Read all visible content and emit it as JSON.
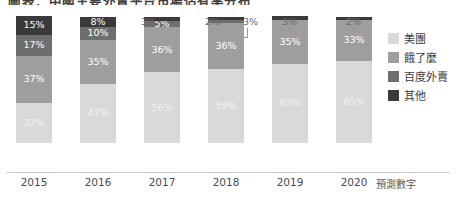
{
  "title": "圖表：中國主要外賣平台市場佔有率分布",
  "axis": {
    "categories": [
      "2015",
      "2016",
      "2017",
      "2018",
      "2019",
      "2020"
    ],
    "forecast_note": "預測數字"
  },
  "legend": {
    "position": "right",
    "items": [
      {
        "label": "美團",
        "color": "#d9d9d9"
      },
      {
        "label": "餓了麼",
        "color": "#9e9e9e"
      },
      {
        "label": "百度外賣",
        "color": "#6e6e6e"
      },
      {
        "label": "其他",
        "color": "#3a3a3a"
      }
    ]
  },
  "chart_data": {
    "type": "bar",
    "subtype": "100%-stacked-column",
    "title": "圖表：中國主要外賣平台市場佔有率分布",
    "xlabel": "",
    "ylabel": "",
    "ylim": [
      0,
      100
    ],
    "grid": false,
    "unit": "%",
    "categories": [
      "2015",
      "2016",
      "2017",
      "2018",
      "2019",
      "2020"
    ],
    "series": [
      {
        "name": "美團",
        "color": "#d9d9d9",
        "values": [
          32,
          47,
          56,
          59,
          63,
          65
        ]
      },
      {
        "name": "餓了麼",
        "color": "#9e9e9e",
        "values": [
          37,
          35,
          36,
          36,
          35,
          33
        ]
      },
      {
        "name": "百度外賣",
        "color": "#6e6e6e",
        "values": [
          17,
          10,
          5,
          3,
          null,
          null
        ]
      },
      {
        "name": "其他",
        "color": "#3a3a3a",
        "values": [
          15,
          8,
          3,
          2,
          3,
          2
        ]
      }
    ],
    "annotations": [
      {
        "category": "2017",
        "series": "其他",
        "text": "3%",
        "placement": "outside-above"
      },
      {
        "category": "2018",
        "series": "其他",
        "text": "2%",
        "placement": "outside-above"
      },
      {
        "category": "2018",
        "series": "百度外賣",
        "text": "3%",
        "placement": "outside-above",
        "leader_line": true
      },
      {
        "category": "2019",
        "series": "其他",
        "text": "3%",
        "placement": "outside-above"
      },
      {
        "category": "2020",
        "series": "其他",
        "text": "2%",
        "placement": "outside-above"
      }
    ]
  },
  "bars": [
    {
      "category": "2015",
      "left": 16,
      "segments": [
        {
          "series": "其他",
          "value": 15,
          "label": "15%",
          "color": "#3a3a3a",
          "inside": true
        },
        {
          "series": "百度外賣",
          "value": 17,
          "label": "17%",
          "color": "#6e6e6e",
          "inside": true
        },
        {
          "series": "餓了麼",
          "value": 37,
          "label": "37%",
          "color": "#9e9e9e",
          "inside": true
        },
        {
          "series": "美團",
          "value": 32,
          "label": "32%",
          "color": "#d9d9d9",
          "inside": true
        }
      ],
      "outside": []
    },
    {
      "category": "2016",
      "left": 80,
      "segments": [
        {
          "series": "其他",
          "value": 8,
          "label": "8%",
          "color": "#3a3a3a",
          "inside": true
        },
        {
          "series": "百度外賣",
          "value": 10,
          "label": "10%",
          "color": "#6e6e6e",
          "inside": true
        },
        {
          "series": "餓了麼",
          "value": 35,
          "label": "35%",
          "color": "#9e9e9e",
          "inside": true
        },
        {
          "series": "美團",
          "value": 47,
          "label": "47%",
          "color": "#d9d9d9",
          "inside": true
        }
      ],
      "outside": []
    },
    {
      "category": "2017",
      "left": 144,
      "segments": [
        {
          "series": "其他",
          "value": 3,
          "label": "",
          "color": "#3a3a3a",
          "inside": false
        },
        {
          "series": "百度外賣",
          "value": 5,
          "label": "5%",
          "color": "#6e6e6e",
          "inside": true
        },
        {
          "series": "餓了麼",
          "value": 36,
          "label": "36%",
          "color": "#9e9e9e",
          "inside": true
        },
        {
          "series": "美團",
          "value": 56,
          "label": "56%",
          "color": "#d9d9d9",
          "inside": true
        }
      ],
      "outside": [
        {
          "label": "3%",
          "x": 141,
          "y": 16,
          "leader": "none"
        }
      ]
    },
    {
      "category": "2018",
      "left": 208,
      "segments": [
        {
          "series": "其他",
          "value": 2,
          "label": "",
          "color": "#3a3a3a",
          "inside": false
        },
        {
          "series": "百度外賣",
          "value": 3,
          "label": "",
          "color": "#6e6e6e",
          "inside": false
        },
        {
          "series": "餓了麼",
          "value": 36,
          "label": "36%",
          "color": "#9e9e9e",
          "inside": true
        },
        {
          "series": "美團",
          "value": 59,
          "label": "59%",
          "color": "#d9d9d9",
          "inside": true
        }
      ],
      "outside": [
        {
          "label": "2%",
          "x": 205,
          "y": 16,
          "leader": "none"
        },
        {
          "label": "3%",
          "x": 243,
          "y": 16,
          "leader": "elbow"
        }
      ]
    },
    {
      "category": "2019",
      "left": 272,
      "segments": [
        {
          "series": "其他",
          "value": 3,
          "label": "",
          "color": "#3a3a3a",
          "inside": false
        },
        {
          "series": "餓了麼",
          "value": 35,
          "label": "35%",
          "color": "#9e9e9e",
          "inside": true
        },
        {
          "series": "美團",
          "value": 63,
          "label": "63%",
          "color": "#d9d9d9",
          "inside": true
        }
      ],
      "outside": [
        {
          "label": "3%",
          "x": 282,
          "y": 16,
          "leader": "stub"
        }
      ]
    },
    {
      "category": "2020",
      "left": 336,
      "segments": [
        {
          "series": "其他",
          "value": 2,
          "label": "",
          "color": "#3a3a3a",
          "inside": false
        },
        {
          "series": "餓了麼",
          "value": 33,
          "label": "33%",
          "color": "#9e9e9e",
          "inside": true
        },
        {
          "series": "美團",
          "value": 65,
          "label": "65%",
          "color": "#d9d9d9",
          "inside": true
        }
      ],
      "outside": [
        {
          "label": "2%",
          "x": 346,
          "y": 16,
          "leader": "stub"
        }
      ]
    }
  ]
}
